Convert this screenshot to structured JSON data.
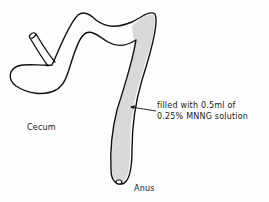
{
  "diagram": {
    "type": "anatomical schematic",
    "colors": {
      "outline": "#111111",
      "fill_region": "#d9d9d9",
      "background": "#fdfdfd"
    },
    "labels": {
      "cecum": "Cecum",
      "anus": "Anus"
    },
    "annotation": {
      "line1": "filled with 0.5ml of",
      "line2": "0.25% MNNG solution"
    }
  }
}
